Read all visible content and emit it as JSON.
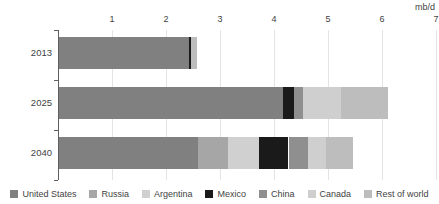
{
  "chart_data": {
    "type": "bar",
    "orientation": "horizontal",
    "stacked": true,
    "title": "",
    "subtitle": "",
    "xlabel": "",
    "ylabel": "",
    "units_label": "mb/d",
    "xlim": [
      0,
      7
    ],
    "xticks": [
      1,
      2,
      3,
      4,
      5,
      6,
      7
    ],
    "xtick_labels": [
      "1",
      "2",
      "3",
      "4",
      "5",
      "6",
      "7"
    ],
    "grid": true,
    "legend_position": "bottom",
    "categories": [
      "2013",
      "2025",
      "2040"
    ],
    "series": [
      {
        "name": "United States",
        "color": "#808080",
        "values": [
          2.4,
          4.15,
          2.58
        ]
      },
      {
        "name": "Russia",
        "color": "#a6a6a6",
        "values": [
          0.0,
          0.0,
          0.55
        ]
      },
      {
        "name": "Argentina",
        "color": "#d0d0d0",
        "values": [
          0.0,
          0.0,
          0.58
        ]
      },
      {
        "name": "Mexico",
        "color": "#1a1a1a",
        "values": [
          0.05,
          0.2,
          0.54
        ]
      },
      {
        "name": "China",
        "color": "#8f8f8f",
        "values": [
          0.0,
          0.16,
          0.36
        ]
      },
      {
        "name": "Canada",
        "color": "#cfcfcf",
        "values": [
          0.0,
          0.72,
          0.34
        ]
      },
      {
        "name": "Rest of world",
        "color": "#bdbdbd",
        "values": [
          0.1,
          0.87,
          0.5
        ]
      }
    ],
    "totals": [
      2.55,
      6.1,
      5.45
    ]
  },
  "legend": {
    "items": [
      {
        "label": "United States"
      },
      {
        "label": "Russia"
      },
      {
        "label": "Argentina"
      },
      {
        "label": "Mexico"
      },
      {
        "label": "China"
      },
      {
        "label": "Canada"
      },
      {
        "label": "Rest of world"
      }
    ]
  },
  "colors": {
    "axis": "#5f5f5f",
    "grid": "#e4e4e4",
    "text": "#3f3f3f",
    "background": "#ffffff"
  }
}
